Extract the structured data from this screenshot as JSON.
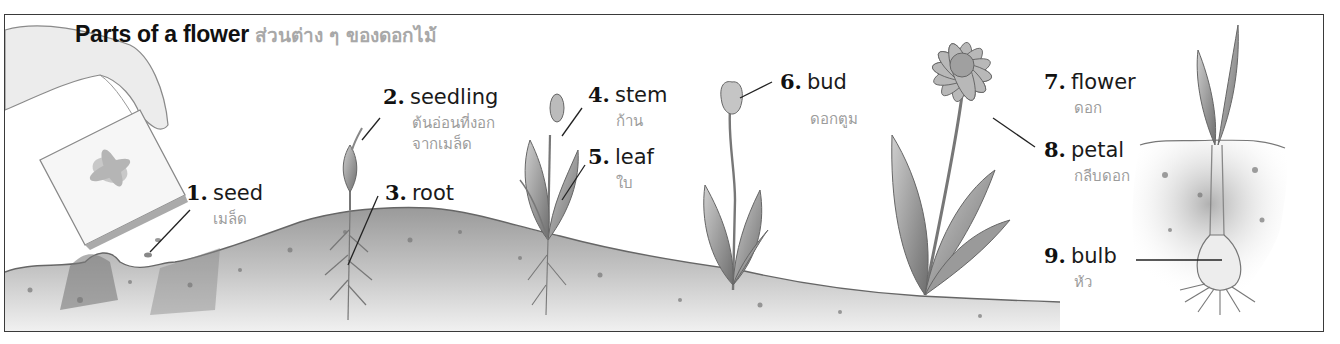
{
  "title": {
    "english": "Parts of a flower",
    "thai": "ส่วนต่าง ๆ ของดอกไม้"
  },
  "labels": [
    {
      "number": "1.",
      "english": "seed",
      "thai": "เมล็ด"
    },
    {
      "number": "2.",
      "english": "seedling",
      "thai": "ต้นอ่อนที่งอก",
      "thai_line2": "จากเมล็ด"
    },
    {
      "number": "3.",
      "english": "root",
      "thai": ""
    },
    {
      "number": "4.",
      "english": "stem",
      "thai": "ก้าน"
    },
    {
      "number": "5.",
      "english": "leaf",
      "thai": "ใบ"
    },
    {
      "number": "6.",
      "english": "bud",
      "thai": "ดอกตูม"
    },
    {
      "number": "7.",
      "english": "flower",
      "thai": "ดอก"
    },
    {
      "number": "8.",
      "english": "petal",
      "thai": "กลีบดอก"
    },
    {
      "number": "9.",
      "english": "bulb",
      "thai": "หัว"
    }
  ],
  "illustrations": [
    "hand-with-seed-packet-icon",
    "seedling-icon",
    "young-plant-icon",
    "budding-plant-icon",
    "flowering-plant-icon",
    "bulb-plant-icon",
    "soil-icon"
  ],
  "colors": {
    "frame": "#3a3a3a",
    "english_text": "#111111",
    "thai_text": "#9c9c9c",
    "soil": "#8a8a8a"
  }
}
